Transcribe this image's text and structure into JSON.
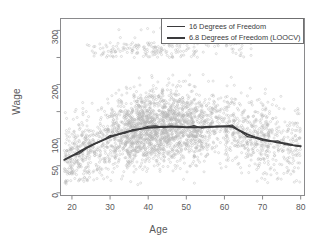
{
  "chart_data": {
    "type": "scatter",
    "title": "",
    "xlabel": "Age",
    "ylabel": "Wage",
    "xlim": [
      17,
      81
    ],
    "ylim": [
      -5,
      322
    ],
    "grid": false,
    "xticks": [
      20,
      30,
      40,
      50,
      60,
      70,
      80
    ],
    "yticks": [
      0,
      50,
      100,
      200,
      300
    ],
    "point_color": "#b4b4b4",
    "point_marker": "open-circle",
    "point_count": 3000,
    "legend": {
      "position": "top-right",
      "boxed": true,
      "entries": [
        {
          "label": "16 Degrees of Freedom",
          "color": "#3a3a3c",
          "width": 1
        },
        {
          "label": "6.8 Degrees of Freedom (LOOCV)",
          "color": "#3a3a3c",
          "width": 2
        }
      ]
    },
    "series": [
      {
        "name": "16 Degrees of Freedom",
        "type": "line",
        "color": "#3a3a3c",
        "x": [
          18,
          20,
          22,
          24,
          26,
          28,
          30,
          32,
          34,
          36,
          38,
          40,
          42,
          44,
          46,
          48,
          50,
          52,
          54,
          56,
          58,
          60,
          62,
          64,
          66,
          68,
          70,
          72,
          74,
          76,
          78,
          80
        ],
        "y": [
          60,
          67,
          75,
          83,
          90,
          97,
          103,
          108,
          112,
          116,
          119,
          121,
          122,
          123,
          123,
          122,
          121,
          121,
          121,
          122,
          123,
          124,
          123,
          113,
          106,
          101,
          98,
          95,
          93,
          90,
          88,
          85
        ]
      },
      {
        "name": "6.8 Degrees of Freedom (LOOCV)",
        "type": "line",
        "color": "#3a3a3c",
        "x": [
          18,
          20,
          22,
          24,
          26,
          28,
          30,
          32,
          34,
          36,
          38,
          40,
          42,
          44,
          46,
          48,
          50,
          52,
          54,
          56,
          58,
          60,
          62,
          64,
          66,
          68,
          70,
          72,
          74,
          76,
          78,
          80
        ],
        "y": [
          61,
          68,
          76,
          84,
          91,
          97,
          103,
          108,
          112,
          115,
          118,
          120,
          121,
          122,
          122,
          122,
          121,
          121,
          121,
          122,
          122,
          123,
          122,
          115,
          108,
          103,
          99,
          96,
          93,
          91,
          88,
          86
        ]
      }
    ],
    "scatter_notes": {
      "main_cloud": "dense band of wages 40-175 across ages 20-62",
      "high_earner_band": "separate cluster near wage 250-270 across ages 25-65"
    }
  }
}
